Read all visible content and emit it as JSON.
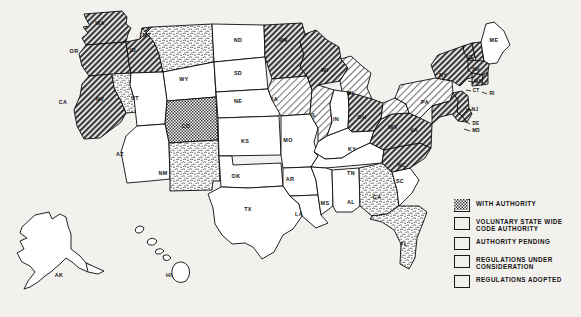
{
  "map": {
    "title": "United States state building code authority status map",
    "colors": {
      "ink": "#0b0b0b",
      "background": "#f2f1ee",
      "fill_white": "#ffffff"
    },
    "legend": {
      "items": [
        {
          "key": "with_authority",
          "label": "WITH AUTHORITY",
          "pattern": "diagonal-hatch-dark"
        },
        {
          "key": "voluntary_state_wide",
          "label": "VOLUNTARY STATE WIDE\nCODE AUTHORITY",
          "pattern": "fine-stipple"
        },
        {
          "key": "authority_pending",
          "label": "AUTHORITY PENDING",
          "pattern": "light-diagonal-hatch"
        },
        {
          "key": "regulations_under_review",
          "label": "REGULATIONS UNDER\nCONSIDERATION",
          "pattern": "mottled-stipple"
        },
        {
          "key": "regulations_adopted",
          "label": "REGULATIONS ADOPTED",
          "pattern": "checker-crosshatch"
        }
      ]
    },
    "states": [
      {
        "abbr": "WA",
        "x": 100,
        "y": 24,
        "status": "with_authority"
      },
      {
        "abbr": "OR",
        "x": 74,
        "y": 52,
        "status": "with_authority"
      },
      {
        "abbr": "CA",
        "x": 63,
        "y": 103,
        "status": "with_authority"
      },
      {
        "abbr": "NV",
        "x": 100,
        "y": 100,
        "status": "regulations_under_review"
      },
      {
        "abbr": "ID",
        "x": 133,
        "y": 51,
        "status": "with_authority"
      },
      {
        "abbr": "MT",
        "x": 147,
        "y": 36,
        "status": "regulations_under_review"
      },
      {
        "abbr": "WY",
        "x": 184,
        "y": 80,
        "status": "none"
      },
      {
        "abbr": "UT",
        "x": 135,
        "y": 99,
        "status": "none"
      },
      {
        "abbr": "CO",
        "x": 186,
        "y": 127,
        "status": "regulations_adopted"
      },
      {
        "abbr": "AZ",
        "x": 120,
        "y": 155,
        "status": "none"
      },
      {
        "abbr": "NM",
        "x": 163,
        "y": 174,
        "status": "regulations_under_review"
      },
      {
        "abbr": "ND",
        "x": 238,
        "y": 41,
        "status": "none"
      },
      {
        "abbr": "SD",
        "x": 238,
        "y": 74,
        "status": "none"
      },
      {
        "abbr": "NE",
        "x": 238,
        "y": 102,
        "status": "none"
      },
      {
        "abbr": "KS",
        "x": 245,
        "y": 142,
        "status": "none"
      },
      {
        "abbr": "OK",
        "x": 236,
        "y": 177,
        "status": "none"
      },
      {
        "abbr": "TX",
        "x": 248,
        "y": 210,
        "status": "none"
      },
      {
        "abbr": "MN",
        "x": 283,
        "y": 41,
        "status": "with_authority"
      },
      {
        "abbr": "IA",
        "x": 275,
        "y": 100,
        "status": "authority_pending"
      },
      {
        "abbr": "MO",
        "x": 288,
        "y": 141,
        "status": "none"
      },
      {
        "abbr": "AR",
        "x": 290,
        "y": 180,
        "status": "none"
      },
      {
        "abbr": "LA",
        "x": 299,
        "y": 215,
        "status": "none"
      },
      {
        "abbr": "WI",
        "x": 325,
        "y": 71,
        "status": "with_authority"
      },
      {
        "abbr": "IL",
        "x": 314,
        "y": 116,
        "status": "authority_pending"
      },
      {
        "abbr": "MI",
        "x": 350,
        "y": 94,
        "status": "authority_pending"
      },
      {
        "abbr": "IN",
        "x": 336,
        "y": 120,
        "status": "none"
      },
      {
        "abbr": "OH",
        "x": 362,
        "y": 118,
        "status": "with_authority"
      },
      {
        "abbr": "KY",
        "x": 352,
        "y": 150,
        "status": "none"
      },
      {
        "abbr": "TN",
        "x": 351,
        "y": 174,
        "status": "none"
      },
      {
        "abbr": "MS",
        "x": 325,
        "y": 204,
        "status": "none"
      },
      {
        "abbr": "AL",
        "x": 351,
        "y": 203,
        "status": "none"
      },
      {
        "abbr": "GA",
        "x": 377,
        "y": 198,
        "status": "regulations_under_review"
      },
      {
        "abbr": "FL",
        "x": 404,
        "y": 245,
        "status": "regulations_under_review"
      },
      {
        "abbr": "SC",
        "x": 400,
        "y": 182,
        "status": "none"
      },
      {
        "abbr": "NC",
        "x": 402,
        "y": 166,
        "status": "with_authority"
      },
      {
        "abbr": "VA",
        "x": 414,
        "y": 131,
        "status": "with_authority"
      },
      {
        "abbr": "WV",
        "x": 393,
        "y": 128,
        "status": "authority_pending"
      },
      {
        "abbr": "PA",
        "x": 425,
        "y": 103,
        "status": "authority_pending"
      },
      {
        "abbr": "NY",
        "x": 443,
        "y": 76,
        "status": "with_authority"
      },
      {
        "abbr": "VT",
        "x": 470,
        "y": 58,
        "status": "with_authority"
      },
      {
        "abbr": "NH",
        "x": 476,
        "y": 70,
        "status": "with_authority"
      },
      {
        "abbr": "ME",
        "x": 494,
        "y": 41,
        "status": "none"
      },
      {
        "abbr": "MA",
        "x": 478,
        "y": 82,
        "status": "with_authority"
      },
      {
        "abbr": "CT",
        "x": 476,
        "y": 91,
        "status": "with_authority"
      },
      {
        "abbr": "RI",
        "x": 492,
        "y": 94,
        "status": "with_authority"
      },
      {
        "abbr": "NJ",
        "x": 475,
        "y": 110,
        "status": "with_authority"
      },
      {
        "abbr": "DE",
        "x": 476,
        "y": 124,
        "status": "with_authority"
      },
      {
        "abbr": "MD",
        "x": 476,
        "y": 131,
        "status": "with_authority"
      },
      {
        "abbr": "AK",
        "x": 59,
        "y": 276,
        "status": "none"
      },
      {
        "abbr": "HI",
        "x": 169,
        "y": 276,
        "status": "none"
      }
    ]
  }
}
